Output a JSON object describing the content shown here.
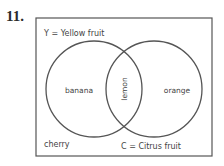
{
  "question": {
    "number": "11."
  },
  "venn": {
    "sets": [
      {
        "id": "Y",
        "label": "Y = Yellow fruit"
      },
      {
        "id": "C",
        "label": "C = Citrus fruit"
      }
    ],
    "regions": {
      "Y_only": "banana",
      "Y_and_C": "lemon",
      "C_only": "orange",
      "outside": "cherry"
    }
  },
  "colors": {
    "line": "#555555",
    "text": "#444444"
  }
}
